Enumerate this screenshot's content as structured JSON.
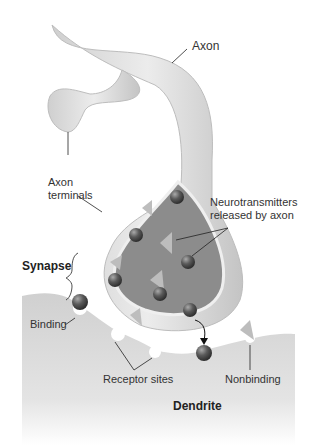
{
  "diagram": {
    "type": "synapse illustration",
    "labels": {
      "axon": "Axon",
      "axon_terminals_line1": "Axon",
      "axon_terminals_line2": "terminals",
      "neurotransmitters_line1": "Neurotransmitters",
      "neurotransmitters_line2": "released by axon",
      "synapse": "Synapse",
      "binding": "Binding",
      "receptor_sites": "Receptor sites",
      "nonbinding": "Nonbinding",
      "dendrite": "Dendrite"
    },
    "colors": {
      "axon_fill": "#d9d9d9",
      "terminal_inner": "#8c8c8c",
      "vesicle_ball": "#555555",
      "triangle": "#bdbdbd",
      "dendrite_fill": "#d6d6d6"
    }
  }
}
